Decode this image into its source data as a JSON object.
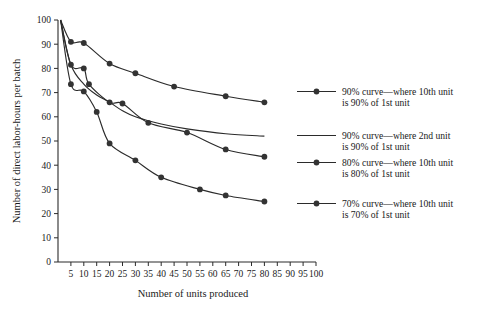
{
  "chart_data": {
    "type": "line",
    "title": "",
    "xlabel": "Number of units produced",
    "ylabel": "Number of direct labor-hours per batch",
    "xlim": [
      0,
      100
    ],
    "ylim": [
      0,
      100
    ],
    "xticks": [
      5,
      10,
      15,
      20,
      25,
      30,
      35,
      40,
      45,
      50,
      55,
      60,
      65,
      70,
      75,
      80,
      85,
      90,
      95,
      100
    ],
    "yticks": [
      0,
      10,
      20,
      30,
      40,
      50,
      60,
      70,
      80,
      90,
      100
    ],
    "grid": false,
    "legend_position": "right-annotations",
    "series": [
      {
        "name": "90% curve—where 10th unit is 90% of 1st unit",
        "marker": "filled-circle",
        "x": [
          1,
          5,
          10,
          20,
          30,
          45,
          65,
          80
        ],
        "y": [
          100,
          91.0,
          90.5,
          82.0,
          78.0,
          72.5,
          68.5,
          66.0
        ]
      },
      {
        "name": "90% curve—where 2nd unit is 90% of 1st unit",
        "marker": "none",
        "x": [
          1,
          5,
          10,
          15,
          20,
          25,
          30,
          40,
          50,
          65,
          80
        ],
        "y": [
          100,
          81.5,
          73.5,
          69.0,
          66.0,
          62.5,
          60.0,
          57.0,
          55.0,
          53.0,
          52.0
        ]
      },
      {
        "name": "80% curve—where 10th unit is 80% of 1st unit",
        "marker": "filled-circle",
        "x": [
          1,
          5,
          10,
          12,
          20,
          25,
          35,
          50,
          65,
          80
        ],
        "y": [
          100,
          81.5,
          80.0,
          73.5,
          66.0,
          65.5,
          57.5,
          53.5,
          46.5,
          43.5
        ]
      },
      {
        "name": "70% curve—where 10th unit is 70% of 1st unit",
        "marker": "filled-circle",
        "x": [
          1,
          5,
          10,
          15,
          20,
          30,
          40,
          55,
          65,
          80
        ],
        "y": [
          100,
          73.5,
          70.5,
          62.0,
          49.0,
          42.0,
          35.0,
          30.0,
          27.5,
          25.0
        ]
      }
    ],
    "annotations": [
      {
        "id": "anno-90-10th",
        "line1": "90% curve—where 10th unit",
        "line2": "is 90% of 1st unit",
        "has_marker": true
      },
      {
        "id": "anno-90-2nd",
        "line1": "90% curve—where 2nd unit",
        "line2": "is 90% of 1st unit",
        "has_marker": false
      },
      {
        "id": "anno-80-10th",
        "line1": "80% curve—where 10th unit",
        "line2": "is 80% of 1st unit",
        "has_marker": true
      },
      {
        "id": "anno-70-10th",
        "line1": "70% curve—where 10th unit",
        "line2": "is 70% of 1st unit",
        "has_marker": true
      }
    ]
  },
  "colors": {
    "ink": "#2b2b2b",
    "marker": "#333333",
    "background": "#ffffff"
  }
}
